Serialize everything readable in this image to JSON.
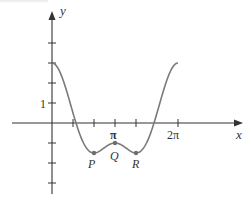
{
  "chart_data": {
    "type": "line",
    "title": "",
    "xlabel": "x",
    "ylabel": "y",
    "function": "y = 2cos(x) + cos(2x)",
    "x_range": [
      0,
      6.2832
    ],
    "y_range_axes": [
      -3.5,
      5.6
    ],
    "x_ticks": [
      {
        "value": 1.0472,
        "label": ""
      },
      {
        "value": 2.0944,
        "label": ""
      },
      {
        "value": 3.1416,
        "label": "π"
      },
      {
        "value": 4.1888,
        "label": ""
      },
      {
        "value": 5.236,
        "label": "2π",
        "tick_at": 6.2832
      }
    ],
    "x_tick_values": [
      1.0472,
      2.0944,
      3.1416,
      4.1888,
      6.2832
    ],
    "y_ticks": [
      {
        "value": -3,
        "label": ""
      },
      {
        "value": -2,
        "label": ""
      },
      {
        "value": -1,
        "label": ""
      },
      {
        "value": 1,
        "label": "1"
      },
      {
        "value": 2,
        "label": ""
      },
      {
        "value": 3,
        "label": ""
      },
      {
        "value": 4,
        "label": ""
      }
    ],
    "points": [
      {
        "name": "P",
        "x": 2.0944,
        "y": -1.5
      },
      {
        "name": "Q",
        "x": 3.1416,
        "y": -1.0
      },
      {
        "name": "R",
        "x": 4.1888,
        "y": -1.5
      }
    ],
    "grid": false,
    "legend": null
  },
  "labels": {
    "x_axis": "x",
    "y_axis": "y",
    "pi": "π",
    "two_pi": "2π",
    "one": "1",
    "P": "P",
    "Q": "Q",
    "R": "R"
  },
  "colors": {
    "axis": "#333333",
    "curve": "#7a7a7a",
    "point": "#6e6e6e"
  }
}
